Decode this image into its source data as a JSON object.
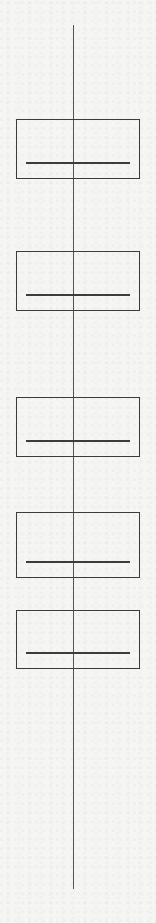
{
  "diagram": {
    "type": "vertical-flow",
    "spine": {
      "x": 73,
      "top": 25,
      "bottom": 889,
      "color": "#555555"
    },
    "nodes": [
      {
        "top": 119,
        "height": 60,
        "bar_offset": 44,
        "label": ""
      },
      {
        "top": 251,
        "height": 60,
        "bar_offset": 44,
        "label": ""
      },
      {
        "top": 397,
        "height": 60,
        "bar_offset": 44,
        "label": ""
      },
      {
        "top": 512,
        "height": 66,
        "bar_offset": 50,
        "label": ""
      },
      {
        "top": 610,
        "height": 59,
        "bar_offset": 43,
        "label": ""
      }
    ],
    "stroke_color": "#3c3c3c",
    "background": "#f5f5f3"
  }
}
